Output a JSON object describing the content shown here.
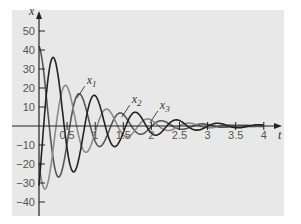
{
  "chart_data": {
    "type": "line",
    "title": "",
    "xlabel": "t",
    "ylabel": "x",
    "xlim": [
      0,
      4.2
    ],
    "ylim": [
      -47,
      55
    ],
    "x_ticks": [
      "0.5",
      "1",
      "1.5",
      "2",
      "2.5",
      "3",
      "3.5",
      "4"
    ],
    "y_ticks": [
      "50",
      "40",
      "30",
      "20",
      "10",
      "-10",
      "-20",
      "-30",
      "-40"
    ],
    "grid": false,
    "background": "#e8e8e8",
    "series": [
      {
        "name": "x1",
        "color": "#555555",
        "description": "damped oscillation, x(0)=~42, decays toward 0",
        "amplitude0": 42,
        "decay": 1.25,
        "omega": 8.6,
        "phase": 0.0
      },
      {
        "name": "x2",
        "color": "#8a8a8a",
        "description": "damped oscillation, starts near 40 dropping quickly",
        "amplitude0": 38,
        "decay": 1.2,
        "omega": 8.6,
        "phase": 2.1
      },
      {
        "name": "x3",
        "color": "#222222",
        "description": "damped oscillation starting at about -45, peaks ~40 near t=0.3",
        "amplitude0": 48,
        "decay": 1.1,
        "omega": 8.6,
        "phase": 4.0
      }
    ],
    "annotations": [
      {
        "text": "x1",
        "x": 0.85,
        "y": 22
      },
      {
        "text": "x2",
        "x": 1.65,
        "y": 12
      },
      {
        "text": "x3",
        "x": 2.15,
        "y": 9
      }
    ]
  },
  "axis": {
    "x_label": "t",
    "y_label": "x"
  }
}
